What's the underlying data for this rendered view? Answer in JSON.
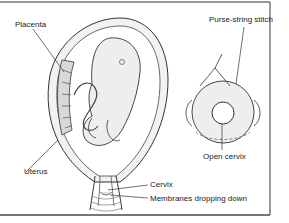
{
  "diagram": {
    "labels": {
      "placenta": "Placenta",
      "uterus": "Uterus",
      "cervix": "Cervix",
      "membranes": "Membranes dropping down",
      "purse_string": "Purse-string stitch",
      "open_cervix": "Open cervix"
    },
    "colors": {
      "line": "#333333",
      "fill_light": "#eeeeee",
      "fill_mid": "#d8d8d8",
      "frame": "#777777"
    }
  }
}
